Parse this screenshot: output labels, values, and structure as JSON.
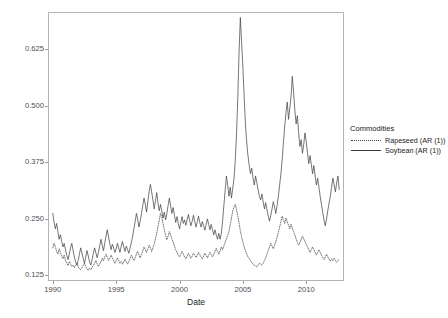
{
  "chart_data": {
    "type": "line",
    "title": "",
    "xlabel": "Date",
    "ylabel": "Annualized volatility",
    "xlim": [
      1989.7,
      2012.9
    ],
    "ylim": [
      0.115,
      0.705
    ],
    "xticks": [
      1990,
      1995,
      2000,
      2005,
      2010
    ],
    "xtick_labels": [
      "1990",
      "1995",
      "2000",
      "2005",
      "2010"
    ],
    "yticks": [
      0.125,
      0.25,
      0.375,
      0.5,
      0.625
    ],
    "ytick_labels": [
      "0.125",
      "0.250",
      "0.375",
      "0.500",
      "0.625"
    ],
    "grid": false,
    "legend_position": "right",
    "legend_title": "Commodities",
    "series": [
      {
        "name": "Rapeseed (AR (1))",
        "linestyle": "dotted",
        "color": "#3b3b3b",
        "x": [
          1990.0,
          1990.1,
          1990.2,
          1990.3,
          1990.4,
          1990.5,
          1990.6,
          1990.7,
          1990.8,
          1990.9,
          1991.0,
          1991.1,
          1991.2,
          1991.3,
          1991.4,
          1991.5,
          1991.6,
          1991.7,
          1991.8,
          1991.9,
          1992.0,
          1992.1,
          1992.2,
          1992.3,
          1992.4,
          1992.5,
          1992.6,
          1992.7,
          1992.8,
          1992.9,
          1993.0,
          1993.1,
          1993.2,
          1993.3,
          1993.4,
          1993.5,
          1993.6,
          1993.7,
          1993.8,
          1993.9,
          1994.0,
          1994.1,
          1994.2,
          1994.3,
          1994.4,
          1994.5,
          1994.6,
          1994.7,
          1994.8,
          1994.9,
          1995.0,
          1995.1,
          1995.2,
          1995.3,
          1995.4,
          1995.5,
          1995.6,
          1995.7,
          1995.8,
          1995.9,
          1996.0,
          1996.1,
          1996.2,
          1996.3,
          1996.4,
          1996.5,
          1996.6,
          1996.7,
          1996.8,
          1996.9,
          1997.0,
          1997.1,
          1997.2,
          1997.3,
          1997.4,
          1997.5,
          1997.6,
          1997.7,
          1997.8,
          1997.9,
          1998.0,
          1998.1,
          1998.2,
          1998.3,
          1998.4,
          1998.5,
          1998.6,
          1998.7,
          1998.8,
          1998.9,
          1999.0,
          1999.1,
          1999.2,
          1999.3,
          1999.4,
          1999.5,
          1999.6,
          1999.7,
          1999.8,
          1999.9,
          2000.0,
          2000.1,
          2000.2,
          2000.3,
          2000.4,
          2000.5,
          2000.6,
          2000.7,
          2000.8,
          2000.9,
          2001.0,
          2001.1,
          2001.2,
          2001.3,
          2001.4,
          2001.5,
          2001.6,
          2001.7,
          2001.8,
          2001.9,
          2002.0,
          2002.1,
          2002.2,
          2002.3,
          2002.4,
          2002.5,
          2002.6,
          2002.7,
          2002.8,
          2002.9,
          2003.0,
          2003.1,
          2003.2,
          2003.3,
          2003.4,
          2003.5,
          2003.6,
          2003.7,
          2003.8,
          2003.9,
          2004.0,
          2004.1,
          2004.2,
          2004.3,
          2004.4,
          2004.5,
          2004.6,
          2004.7,
          2004.8,
          2004.9,
          2005.0,
          2005.1,
          2005.2,
          2005.3,
          2005.4,
          2005.5,
          2005.6,
          2005.7,
          2005.8,
          2005.9,
          2006.0,
          2006.1,
          2006.2,
          2006.3,
          2006.4,
          2006.5,
          2006.6,
          2006.7,
          2006.8,
          2006.9,
          2007.0,
          2007.1,
          2007.2,
          2007.3,
          2007.4,
          2007.5,
          2007.6,
          2007.7,
          2007.8,
          2007.9,
          2008.0,
          2008.1,
          2008.2,
          2008.3,
          2008.4,
          2008.5,
          2008.6,
          2008.7,
          2008.8,
          2008.9,
          2009.0,
          2009.1,
          2009.2,
          2009.3,
          2009.4,
          2009.5,
          2009.6,
          2009.7,
          2009.8,
          2009.9,
          2010.0,
          2010.1,
          2010.2,
          2010.3,
          2010.4,
          2010.5,
          2010.6,
          2010.7,
          2010.8,
          2010.9,
          2011.0,
          2011.1,
          2011.2,
          2011.3,
          2011.4,
          2011.5,
          2011.6,
          2011.7,
          2011.8,
          2011.9,
          2012.0,
          2012.1,
          2012.2,
          2012.3,
          2012.4,
          2012.5,
          2012.6
        ],
        "y": [
          0.186,
          0.196,
          0.189,
          0.178,
          0.172,
          0.184,
          0.176,
          0.168,
          0.162,
          0.17,
          0.158,
          0.152,
          0.147,
          0.156,
          0.15,
          0.145,
          0.148,
          0.142,
          0.147,
          0.152,
          0.145,
          0.14,
          0.138,
          0.142,
          0.147,
          0.152,
          0.145,
          0.139,
          0.136,
          0.141,
          0.138,
          0.143,
          0.147,
          0.152,
          0.158,
          0.15,
          0.145,
          0.15,
          0.156,
          0.163,
          0.158,
          0.166,
          0.172,
          0.165,
          0.158,
          0.163,
          0.17,
          0.164,
          0.158,
          0.152,
          0.158,
          0.164,
          0.158,
          0.152,
          0.156,
          0.15,
          0.155,
          0.161,
          0.155,
          0.15,
          0.156,
          0.162,
          0.17,
          0.164,
          0.158,
          0.164,
          0.172,
          0.178,
          0.17,
          0.164,
          0.172,
          0.18,
          0.188,
          0.182,
          0.176,
          0.184,
          0.192,
          0.186,
          0.178,
          0.186,
          0.194,
          0.206,
          0.218,
          0.232,
          0.248,
          0.262,
          0.255,
          0.24,
          0.226,
          0.214,
          0.204,
          0.212,
          0.222,
          0.214,
          0.206,
          0.198,
          0.19,
          0.182,
          0.176,
          0.17,
          0.166,
          0.172,
          0.178,
          0.172,
          0.166,
          0.162,
          0.168,
          0.174,
          0.168,
          0.163,
          0.168,
          0.174,
          0.17,
          0.165,
          0.17,
          0.176,
          0.171,
          0.166,
          0.162,
          0.168,
          0.174,
          0.169,
          0.164,
          0.17,
          0.176,
          0.171,
          0.166,
          0.172,
          0.178,
          0.185,
          0.178,
          0.172,
          0.18,
          0.188,
          0.182,
          0.19,
          0.198,
          0.206,
          0.214,
          0.222,
          0.236,
          0.252,
          0.268,
          0.276,
          0.282,
          0.27,
          0.256,
          0.24,
          0.224,
          0.21,
          0.198,
          0.188,
          0.18,
          0.172,
          0.166,
          0.162,
          0.158,
          0.154,
          0.15,
          0.148,
          0.146,
          0.144,
          0.148,
          0.152,
          0.15,
          0.148,
          0.152,
          0.158,
          0.164,
          0.172,
          0.18,
          0.188,
          0.196,
          0.19,
          0.184,
          0.192,
          0.2,
          0.21,
          0.22,
          0.232,
          0.244,
          0.256,
          0.248,
          0.24,
          0.252,
          0.244,
          0.236,
          0.228,
          0.238,
          0.23,
          0.222,
          0.214,
          0.206,
          0.198,
          0.192,
          0.198,
          0.205,
          0.212,
          0.206,
          0.2,
          0.194,
          0.188,
          0.182,
          0.176,
          0.182,
          0.188,
          0.182,
          0.176,
          0.17,
          0.176,
          0.182,
          0.176,
          0.17,
          0.165,
          0.16,
          0.166,
          0.172,
          0.166,
          0.161,
          0.157,
          0.162,
          0.158,
          0.163,
          0.158,
          0.154,
          0.158,
          0.162
        ]
      },
      {
        "name": "Soybean (AR (1))",
        "linestyle": "solid",
        "color": "#3b3b3b",
        "x": [
          1990.0,
          1990.1,
          1990.2,
          1990.3,
          1990.4,
          1990.5,
          1990.6,
          1990.7,
          1990.8,
          1990.9,
          1991.0,
          1991.1,
          1991.2,
          1991.3,
          1991.4,
          1991.5,
          1991.6,
          1991.7,
          1991.8,
          1991.9,
          1992.0,
          1992.1,
          1992.2,
          1992.3,
          1992.4,
          1992.5,
          1992.6,
          1992.7,
          1992.8,
          1992.9,
          1993.0,
          1993.1,
          1993.2,
          1993.3,
          1993.4,
          1993.5,
          1993.6,
          1993.7,
          1993.8,
          1993.9,
          1994.0,
          1994.1,
          1994.2,
          1994.3,
          1994.4,
          1994.5,
          1994.6,
          1994.7,
          1994.8,
          1994.9,
          1995.0,
          1995.1,
          1995.2,
          1995.3,
          1995.4,
          1995.5,
          1995.6,
          1995.7,
          1995.8,
          1995.9,
          1996.0,
          1996.1,
          1996.2,
          1996.3,
          1996.4,
          1996.5,
          1996.6,
          1996.7,
          1996.8,
          1996.9,
          1997.0,
          1997.1,
          1997.2,
          1997.3,
          1997.4,
          1997.5,
          1997.6,
          1997.7,
          1997.8,
          1997.9,
          1998.0,
          1998.1,
          1998.2,
          1998.3,
          1998.4,
          1998.5,
          1998.6,
          1998.7,
          1998.8,
          1998.9,
          1999.0,
          1999.1,
          1999.2,
          1999.3,
          1999.4,
          1999.5,
          1999.6,
          1999.7,
          1999.8,
          1999.9,
          2000.0,
          2000.1,
          2000.2,
          2000.3,
          2000.4,
          2000.5,
          2000.6,
          2000.7,
          2000.8,
          2000.9,
          2001.0,
          2001.1,
          2001.2,
          2001.3,
          2001.4,
          2001.5,
          2001.6,
          2001.7,
          2001.8,
          2001.9,
          2002.0,
          2002.1,
          2002.2,
          2002.3,
          2002.4,
          2002.5,
          2002.6,
          2002.7,
          2002.8,
          2002.9,
          2003.0,
          2003.1,
          2003.2,
          2003.3,
          2003.4,
          2003.5,
          2003.6,
          2003.7,
          2003.8,
          2003.9,
          2004.0,
          2004.1,
          2004.2,
          2004.3,
          2004.4,
          2004.5,
          2004.6,
          2004.7,
          2004.8,
          2004.9,
          2005.0,
          2005.1,
          2005.2,
          2005.3,
          2005.4,
          2005.5,
          2005.6,
          2005.7,
          2005.8,
          2005.9,
          2006.0,
          2006.1,
          2006.2,
          2006.3,
          2006.4,
          2006.5,
          2006.6,
          2006.7,
          2006.8,
          2006.9,
          2007.0,
          2007.1,
          2007.2,
          2007.3,
          2007.4,
          2007.5,
          2007.6,
          2007.7,
          2007.8,
          2007.9,
          2008.0,
          2008.1,
          2008.2,
          2008.3,
          2008.4,
          2008.5,
          2008.6,
          2008.7,
          2008.8,
          2008.9,
          2009.0,
          2009.1,
          2009.2,
          2009.3,
          2009.4,
          2009.5,
          2009.6,
          2009.7,
          2009.8,
          2009.9,
          2010.0,
          2010.1,
          2010.2,
          2010.3,
          2010.4,
          2010.5,
          2010.6,
          2010.7,
          2010.8,
          2010.9,
          2011.0,
          2011.1,
          2011.2,
          2011.3,
          2011.4,
          2011.5,
          2011.6,
          2011.7,
          2011.8,
          2011.9,
          2012.0,
          2012.1,
          2012.2,
          2012.3,
          2012.4,
          2012.5,
          2012.6
        ],
        "y": [
          0.262,
          0.243,
          0.228,
          0.24,
          0.222,
          0.205,
          0.215,
          0.2,
          0.188,
          0.196,
          0.182,
          0.17,
          0.16,
          0.172,
          0.186,
          0.196,
          0.18,
          0.166,
          0.155,
          0.148,
          0.158,
          0.172,
          0.186,
          0.175,
          0.162,
          0.152,
          0.166,
          0.18,
          0.168,
          0.155,
          0.148,
          0.16,
          0.174,
          0.186,
          0.175,
          0.164,
          0.176,
          0.19,
          0.205,
          0.192,
          0.18,
          0.196,
          0.212,
          0.226,
          0.21,
          0.195,
          0.182,
          0.194,
          0.186,
          0.176,
          0.184,
          0.196,
          0.186,
          0.176,
          0.19,
          0.2,
          0.188,
          0.178,
          0.19,
          0.182,
          0.174,
          0.186,
          0.198,
          0.212,
          0.228,
          0.245,
          0.262,
          0.248,
          0.232,
          0.246,
          0.262,
          0.28,
          0.296,
          0.282,
          0.265,
          0.288,
          0.31,
          0.326,
          0.31,
          0.292,
          0.272,
          0.29,
          0.308,
          0.285,
          0.268,
          0.282,
          0.268,
          0.252,
          0.265,
          0.248,
          0.262,
          0.28,
          0.296,
          0.278,
          0.262,
          0.275,
          0.258,
          0.242,
          0.255,
          0.24,
          0.228,
          0.242,
          0.255,
          0.24,
          0.248,
          0.236,
          0.248,
          0.26,
          0.246,
          0.235,
          0.245,
          0.258,
          0.244,
          0.232,
          0.244,
          0.256,
          0.242,
          0.232,
          0.244,
          0.235,
          0.225,
          0.238,
          0.25,
          0.238,
          0.226,
          0.238,
          0.226,
          0.215,
          0.226,
          0.214,
          0.205,
          0.218,
          0.205,
          0.218,
          0.246,
          0.28,
          0.312,
          0.345,
          0.325,
          0.3,
          0.32,
          0.296,
          0.318,
          0.34,
          0.38,
          0.44,
          0.52,
          0.62,
          0.695,
          0.64,
          0.585,
          0.52,
          0.46,
          0.42,
          0.39,
          0.368,
          0.35,
          0.362,
          0.34,
          0.325,
          0.345,
          0.33,
          0.315,
          0.3,
          0.292,
          0.305,
          0.288,
          0.272,
          0.286,
          0.27,
          0.256,
          0.245,
          0.258,
          0.272,
          0.288,
          0.276,
          0.262,
          0.28,
          0.3,
          0.325,
          0.35,
          0.38,
          0.42,
          0.455,
          0.485,
          0.508,
          0.47,
          0.495,
          0.52,
          0.565,
          0.53,
          0.49,
          0.46,
          0.478,
          0.44,
          0.41,
          0.425,
          0.395,
          0.415,
          0.44,
          0.42,
          0.395,
          0.372,
          0.39,
          0.37,
          0.35,
          0.368,
          0.345,
          0.325,
          0.34,
          0.32,
          0.3,
          0.282,
          0.265,
          0.248,
          0.235,
          0.25,
          0.268,
          0.285,
          0.3,
          0.32,
          0.34,
          0.325,
          0.31,
          0.33,
          0.345,
          0.315
        ]
      }
    ]
  },
  "legend": {
    "title": "Commodities",
    "items": [
      {
        "label": "Rapeseed (AR (1))",
        "style": "dotted"
      },
      {
        "label": "Soybean (AR (1))",
        "style": "solid"
      }
    ]
  },
  "axes": {
    "ylabel": "Annualized volatility",
    "xlabel": "Date"
  }
}
